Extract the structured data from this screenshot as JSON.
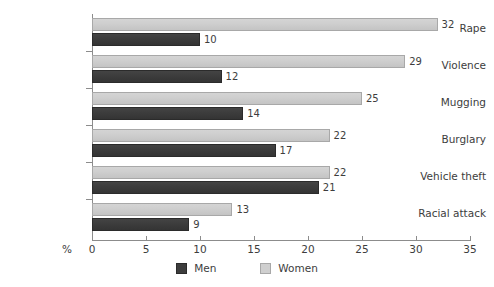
{
  "chart_data": {
    "type": "bar",
    "orientation": "horizontal",
    "title": "",
    "xlabel": "%",
    "ylabel": "",
    "xlim": [
      0,
      35
    ],
    "xticks": [
      0,
      5,
      10,
      15,
      20,
      25,
      30,
      35
    ],
    "grid": false,
    "legend_position": "bottom-center",
    "categories": [
      "Rape",
      "Violence",
      "Mugging",
      "Burglary",
      "Vehicle theft",
      "Racial attack"
    ],
    "series": [
      {
        "name": "Men",
        "color": "#3d3d3d",
        "values": [
          10,
          12,
          14,
          17,
          21,
          9
        ]
      },
      {
        "name": "Women",
        "color": "#cfcfcf",
        "values": [
          32,
          29,
          25,
          22,
          22,
          13
        ]
      }
    ]
  },
  "axis": {
    "unit_label": "%",
    "tick_labels": [
      "0",
      "5",
      "10",
      "15",
      "20",
      "25",
      "30",
      "35"
    ]
  },
  "categories": [
    {
      "label": "Rape",
      "men": "10",
      "women": "32"
    },
    {
      "label": "Violence",
      "men": "12",
      "women": "29"
    },
    {
      "label": "Mugging",
      "men": "14",
      "women": "25"
    },
    {
      "label": "Burglary",
      "men": "17",
      "women": "22"
    },
    {
      "label": "Vehicle theft",
      "men": "21",
      "women": "22"
    },
    {
      "label": "Racial attack",
      "men": "9",
      "women": "13"
    }
  ],
  "legend": {
    "men_label": "Men",
    "women_label": "Women"
  },
  "colors": {
    "men": "#3d3d3d",
    "women": "#cfcfcf",
    "axis": "#8c8c8c",
    "text": "#3d3d3d",
    "background": "#ffffff"
  }
}
